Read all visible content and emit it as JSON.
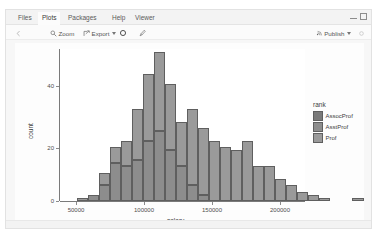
{
  "window": {
    "tabs": [
      {
        "label": "Files",
        "active": false,
        "x": 8
      },
      {
        "label": "Plots",
        "active": true,
        "x": 32
      },
      {
        "label": "Packages",
        "active": false,
        "x": 58
      },
      {
        "label": "Help",
        "active": false,
        "x": 100
      },
      {
        "label": "Viewer",
        "active": false,
        "x": 123
      }
    ],
    "controls": {
      "minimize": "minimize-icon",
      "maximize": "maximize-icon"
    }
  },
  "toolbar": {
    "back_label": "",
    "zoom_label": "Zoom",
    "export_label": "Export",
    "refresh_label": "",
    "brush_label": "",
    "publish_label": "Publish"
  },
  "chart_data": {
    "type": "bar",
    "subtype": "stacked-histogram",
    "title": "",
    "xlabel": "salary",
    "ylabel": "count",
    "xlim": [
      45000,
      230000
    ],
    "ylim": [
      0,
      48
    ],
    "xticks": [
      50000,
      100000,
      150000,
      200000
    ],
    "yticks": [
      0,
      20,
      40
    ],
    "grid": false,
    "legend": {
      "title": "rank",
      "position": "right",
      "entries": [
        {
          "label": "AssocProf",
          "color": "#7a7a7a"
        },
        {
          "label": "AsstProf",
          "color": "#8d8d8d"
        },
        {
          "label": "Prof",
          "color": "#9a9a9a"
        }
      ]
    },
    "bin_centers": [
      52500,
      57500,
      62500,
      67500,
      72500,
      77500,
      82500,
      87500,
      92500,
      97500,
      102500,
      107500,
      112500,
      117500,
      122500,
      127500,
      132500,
      137500,
      142500,
      147500,
      152500,
      157500,
      162500,
      167500,
      172500,
      177500,
      182500,
      187500,
      192500,
      197500,
      202500,
      207500,
      212500,
      217500,
      222500
    ],
    "series": [
      {
        "name": "Prof",
        "values": [
          0,
          0,
          0,
          0,
          1,
          3,
          5,
          11,
          12,
          25,
          21,
          14,
          24,
          21,
          18,
          17,
          16,
          19,
          14,
          11,
          11,
          10,
          7,
          5,
          4,
          3,
          2,
          1,
          0,
          0,
          0,
          0,
          0,
          0,
          1
        ]
      },
      {
        "name": "AsstProf",
        "values": [
          0,
          0,
          1,
          2,
          7,
          12,
          11,
          13,
          19,
          12,
          11,
          7,
          3,
          1,
          0,
          0,
          0,
          0,
          0,
          0,
          0,
          0,
          0,
          0,
          0,
          0,
          0,
          0,
          0,
          0,
          0,
          0,
          0,
          0,
          0
        ]
      },
      {
        "name": "AssocProf",
        "values": [
          0,
          0,
          0,
          0,
          1,
          2,
          3,
          5,
          9,
          10,
          5,
          4,
          2,
          1,
          1,
          0,
          0,
          0,
          0,
          0,
          0,
          0,
          0,
          0,
          0,
          0,
          0,
          0,
          0,
          0,
          0,
          0,
          0,
          0,
          0
        ]
      }
    ],
    "totals": [
      0,
      0,
      1,
      2,
      9,
      17,
      19,
      29,
      40,
      47,
      37,
      25,
      29,
      23,
      19,
      17,
      16,
      19,
      14,
      11,
      11,
      10,
      7,
      5,
      4,
      3,
      2,
      1,
      0,
      0,
      0,
      0,
      0,
      0,
      1
    ]
  },
  "bars_render": [
    {
      "x": 17,
      "w": 11,
      "total": 1,
      "segs": [
        {
          "h": 1,
          "c": "#9a9a9a"
        }
      ]
    },
    {
      "x": 28,
      "w": 11,
      "total": 2,
      "segs": [
        {
          "h": 2,
          "c": "#8d8d8d"
        }
      ]
    },
    {
      "x": 39,
      "w": 11,
      "total": 9,
      "segs": [
        {
          "h": 5,
          "c": "#8d8d8d"
        },
        {
          "h": 4,
          "c": "#9a9a9a"
        }
      ]
    },
    {
      "x": 50,
      "w": 11,
      "total": 17,
      "segs": [
        {
          "h": 12,
          "c": "#8d8d8d"
        },
        {
          "h": 5,
          "c": "#9a9a9a"
        }
      ]
    },
    {
      "x": 61,
      "w": 11,
      "total": 19,
      "segs": [
        {
          "h": 11,
          "c": "#8d8d8d"
        },
        {
          "h": 8,
          "c": "#9a9a9a"
        }
      ]
    },
    {
      "x": 72,
      "w": 11,
      "total": 29,
      "segs": [
        {
          "h": 13,
          "c": "#8d8d8d"
        },
        {
          "h": 16,
          "c": "#9a9a9a"
        }
      ]
    },
    {
      "x": 83,
      "w": 11,
      "total": 40,
      "segs": [
        {
          "h": 19,
          "c": "#8d8d8d"
        },
        {
          "h": 21,
          "c": "#9a9a9a"
        }
      ]
    },
    {
      "x": 94,
      "w": 11,
      "total": 47,
      "segs": [
        {
          "h": 22,
          "c": "#8d8d8d"
        },
        {
          "h": 25,
          "c": "#9a9a9a"
        }
      ]
    },
    {
      "x": 105,
      "w": 11,
      "total": 37,
      "segs": [
        {
          "h": 16,
          "c": "#8d8d8d"
        },
        {
          "h": 21,
          "c": "#9a9a9a"
        }
      ]
    },
    {
      "x": 116,
      "w": 11,
      "total": 25,
      "segs": [
        {
          "h": 11,
          "c": "#8d8d8d"
        },
        {
          "h": 14,
          "c": "#9a9a9a"
        }
      ]
    },
    {
      "x": 127,
      "w": 11,
      "total": 29,
      "segs": [
        {
          "h": 5,
          "c": "#8d8d8d"
        },
        {
          "h": 24,
          "c": "#9a9a9a"
        }
      ]
    },
    {
      "x": 138,
      "w": 11,
      "total": 23,
      "segs": [
        {
          "h": 2,
          "c": "#8d8d8d"
        },
        {
          "h": 21,
          "c": "#9a9a9a"
        }
      ]
    },
    {
      "x": 149,
      "w": 11,
      "total": 19,
      "segs": [
        {
          "h": 19,
          "c": "#9a9a9a"
        }
      ]
    },
    {
      "x": 160,
      "w": 11,
      "total": 17,
      "segs": [
        {
          "h": 17,
          "c": "#9a9a9a"
        }
      ]
    },
    {
      "x": 171,
      "w": 11,
      "total": 16,
      "segs": [
        {
          "h": 16,
          "c": "#9a9a9a"
        }
      ]
    },
    {
      "x": 182,
      "w": 11,
      "total": 19,
      "segs": [
        {
          "h": 19,
          "c": "#9a9a9a"
        }
      ]
    },
    {
      "x": 193,
      "w": 11,
      "total": 11,
      "segs": [
        {
          "h": 11,
          "c": "#9a9a9a"
        }
      ]
    },
    {
      "x": 204,
      "w": 11,
      "total": 11,
      "segs": [
        {
          "h": 11,
          "c": "#9a9a9a"
        }
      ]
    },
    {
      "x": 215,
      "w": 11,
      "total": 7,
      "segs": [
        {
          "h": 7,
          "c": "#9a9a9a"
        }
      ]
    },
    {
      "x": 226,
      "w": 11,
      "total": 5,
      "segs": [
        {
          "h": 5,
          "c": "#9a9a9a"
        }
      ]
    },
    {
      "x": 237,
      "w": 11,
      "total": 3,
      "segs": [
        {
          "h": 3,
          "c": "#9a9a9a"
        }
      ]
    },
    {
      "x": 248,
      "w": 11,
      "total": 2,
      "segs": [
        {
          "h": 2,
          "c": "#9a9a9a"
        }
      ]
    },
    {
      "x": 259,
      "w": 11,
      "total": 1,
      "segs": [
        {
          "h": 1,
          "c": "#9a9a9a"
        }
      ]
    },
    {
      "x": 292,
      "w": 12,
      "total": 1,
      "segs": [
        {
          "h": 1,
          "c": "#9a9a9a"
        }
      ]
    }
  ],
  "axis_render": {
    "yticks": [
      {
        "label": "40",
        "y": 37
      },
      {
        "label": "20",
        "y": 99
      },
      {
        "label": "0",
        "y": 152
      }
    ],
    "xticks": [
      {
        "label": "50000",
        "x": 16
      },
      {
        "label": "100000",
        "x": 84
      },
      {
        "label": "150000",
        "x": 152
      },
      {
        "label": "200000",
        "x": 220
      }
    ]
  }
}
